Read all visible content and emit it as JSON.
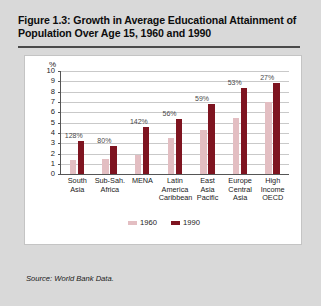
{
  "figure": {
    "title": "Figure 1.3: Growth in Average Educational Attainment of Population Over Age 15, 1960 and 1990",
    "source": "Source: World Bank Data."
  },
  "chart_data": {
    "type": "bar",
    "title": "",
    "xlabel": "",
    "ylabel": "%",
    "ylim": [
      0,
      10
    ],
    "yticks": [
      "0",
      "1",
      "2",
      "3",
      "4",
      "5",
      "6",
      "7",
      "8",
      "9",
      "10"
    ],
    "grid": true,
    "legend_position": "bottom",
    "categories": [
      "South Asia",
      "Sub-Sah. Africa",
      "MENA",
      "Latin America Caribbean",
      "East Asia Pacific",
      "Europe Central Asia",
      "High Income OECD"
    ],
    "category_lines": [
      [
        "South",
        "Asia"
      ],
      [
        "Sub-Sah.",
        "Africa"
      ],
      [
        "MENA"
      ],
      [
        "Latin",
        "America",
        "Caribbean"
      ],
      [
        "East",
        "Asia",
        "Pacific"
      ],
      [
        "Europe",
        "Central",
        "Asia"
      ],
      [
        "High",
        "Income",
        "OECD"
      ]
    ],
    "series": [
      {
        "name": "1960",
        "color": "#e3bec2",
        "values": [
          1.4,
          1.5,
          1.9,
          3.5,
          4.3,
          5.5,
          7.0
        ]
      },
      {
        "name": "1990",
        "color": "#7e1420",
        "values": [
          3.2,
          2.7,
          4.6,
          5.4,
          6.8,
          8.4,
          8.9
        ]
      }
    ],
    "growth_labels": [
      "128%",
      "80%",
      "142%",
      "56%",
      "59%",
      "53%",
      "27%"
    ]
  },
  "colors": {
    "page_background": "#d9d9d9",
    "panel_background": "#ffffff",
    "series_1960": "#e3bec2",
    "series_1990": "#7e1420",
    "rule": "#4a4a4a"
  }
}
